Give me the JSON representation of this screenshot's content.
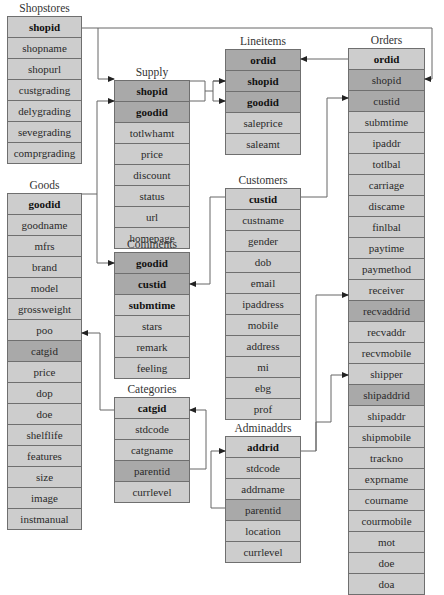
{
  "diagram": {
    "tables": [
      {
        "id": "shopstores",
        "name": "Shopstores",
        "fields": [
          {
            "name": "shopid",
            "pk": true,
            "fk": false
          },
          {
            "name": "shopname",
            "pk": false,
            "fk": false
          },
          {
            "name": "shopurl",
            "pk": false,
            "fk": false
          },
          {
            "name": "custgrading",
            "pk": false,
            "fk": false
          },
          {
            "name": "delygrading",
            "pk": false,
            "fk": false
          },
          {
            "name": "sevegrading",
            "pk": false,
            "fk": false
          },
          {
            "name": "comprgrading",
            "pk": false,
            "fk": false
          }
        ]
      },
      {
        "id": "goods",
        "name": "Goods",
        "fields": [
          {
            "name": "goodid",
            "pk": true,
            "fk": false
          },
          {
            "name": "goodname",
            "pk": false,
            "fk": false
          },
          {
            "name": "mfrs",
            "pk": false,
            "fk": false
          },
          {
            "name": "brand",
            "pk": false,
            "fk": false
          },
          {
            "name": "model",
            "pk": false,
            "fk": false
          },
          {
            "name": "grossweight",
            "pk": false,
            "fk": false
          },
          {
            "name": "poo",
            "pk": false,
            "fk": false
          },
          {
            "name": "catgid",
            "pk": false,
            "fk": true
          },
          {
            "name": "price",
            "pk": false,
            "fk": false
          },
          {
            "name": "dop",
            "pk": false,
            "fk": false
          },
          {
            "name": "doe",
            "pk": false,
            "fk": false
          },
          {
            "name": "shelflife",
            "pk": false,
            "fk": false
          },
          {
            "name": "features",
            "pk": false,
            "fk": false
          },
          {
            "name": "size",
            "pk": false,
            "fk": false
          },
          {
            "name": "image",
            "pk": false,
            "fk": false
          },
          {
            "name": "instmanual",
            "pk": false,
            "fk": false
          }
        ]
      },
      {
        "id": "supply",
        "name": "Supply",
        "fields": [
          {
            "name": "shopid",
            "pk": true,
            "fk": true
          },
          {
            "name": "goodid",
            "pk": true,
            "fk": true
          },
          {
            "name": "totlwhamt",
            "pk": false,
            "fk": false
          },
          {
            "name": "price",
            "pk": false,
            "fk": false
          },
          {
            "name": "discount",
            "pk": false,
            "fk": false
          },
          {
            "name": "status",
            "pk": false,
            "fk": false
          },
          {
            "name": "url",
            "pk": false,
            "fk": false
          },
          {
            "name": "homepage",
            "pk": false,
            "fk": false
          }
        ]
      },
      {
        "id": "comments",
        "name": "Comments",
        "fields": [
          {
            "name": "goodid",
            "pk": true,
            "fk": true
          },
          {
            "name": "custid",
            "pk": true,
            "fk": true
          },
          {
            "name": "submtime",
            "pk": true,
            "fk": false
          },
          {
            "name": "stars",
            "pk": false,
            "fk": false
          },
          {
            "name": "remark",
            "pk": false,
            "fk": false
          },
          {
            "name": "feeling",
            "pk": false,
            "fk": false
          }
        ]
      },
      {
        "id": "categories",
        "name": "Categories",
        "fields": [
          {
            "name": "catgid",
            "pk": true,
            "fk": false
          },
          {
            "name": "stdcode",
            "pk": false,
            "fk": false
          },
          {
            "name": "catgname",
            "pk": false,
            "fk": false
          },
          {
            "name": "parentid",
            "pk": false,
            "fk": true
          },
          {
            "name": "currlevel",
            "pk": false,
            "fk": false
          }
        ]
      },
      {
        "id": "lineitems",
        "name": "Lineitems",
        "fields": [
          {
            "name": "ordid",
            "pk": true,
            "fk": true
          },
          {
            "name": "shopid",
            "pk": true,
            "fk": true
          },
          {
            "name": "goodid",
            "pk": true,
            "fk": true
          },
          {
            "name": "saleprice",
            "pk": false,
            "fk": false
          },
          {
            "name": "saleamt",
            "pk": false,
            "fk": false
          }
        ]
      },
      {
        "id": "customers",
        "name": "Customers",
        "fields": [
          {
            "name": "custid",
            "pk": true,
            "fk": false
          },
          {
            "name": "custname",
            "pk": false,
            "fk": false
          },
          {
            "name": "gender",
            "pk": false,
            "fk": false
          },
          {
            "name": "dob",
            "pk": false,
            "fk": false
          },
          {
            "name": "email",
            "pk": false,
            "fk": false
          },
          {
            "name": "ipaddress",
            "pk": false,
            "fk": false
          },
          {
            "name": "mobile",
            "pk": false,
            "fk": false
          },
          {
            "name": "address",
            "pk": false,
            "fk": false
          },
          {
            "name": "mi",
            "pk": false,
            "fk": false
          },
          {
            "name": "ebg",
            "pk": false,
            "fk": false
          },
          {
            "name": "prof",
            "pk": false,
            "fk": false
          }
        ]
      },
      {
        "id": "adminaddrs",
        "name": "Adminaddrs",
        "fields": [
          {
            "name": "addrid",
            "pk": true,
            "fk": false
          },
          {
            "name": "stdcode",
            "pk": false,
            "fk": false
          },
          {
            "name": "addrname",
            "pk": false,
            "fk": false
          },
          {
            "name": "parentid",
            "pk": false,
            "fk": true
          },
          {
            "name": "location",
            "pk": false,
            "fk": false
          },
          {
            "name": "currlevel",
            "pk": false,
            "fk": false
          }
        ]
      },
      {
        "id": "orders",
        "name": "Orders",
        "fields": [
          {
            "name": "ordid",
            "pk": true,
            "fk": false
          },
          {
            "name": "shopid",
            "pk": false,
            "fk": true
          },
          {
            "name": "custid",
            "pk": false,
            "fk": true
          },
          {
            "name": "submtime",
            "pk": false,
            "fk": false
          },
          {
            "name": "ipaddr",
            "pk": false,
            "fk": false
          },
          {
            "name": "totlbal",
            "pk": false,
            "fk": false
          },
          {
            "name": "carriage",
            "pk": false,
            "fk": false
          },
          {
            "name": "discame",
            "pk": false,
            "fk": false
          },
          {
            "name": "finlbal",
            "pk": false,
            "fk": false
          },
          {
            "name": "paytime",
            "pk": false,
            "fk": false
          },
          {
            "name": "paymethod",
            "pk": false,
            "fk": false
          },
          {
            "name": "receiver",
            "pk": false,
            "fk": false
          },
          {
            "name": "recvaddrid",
            "pk": false,
            "fk": true
          },
          {
            "name": "recvaddr",
            "pk": false,
            "fk": false
          },
          {
            "name": "recvmobile",
            "pk": false,
            "fk": false
          },
          {
            "name": "shipper",
            "pk": false,
            "fk": false
          },
          {
            "name": "shipaddrid",
            "pk": false,
            "fk": true
          },
          {
            "name": "shipaddr",
            "pk": false,
            "fk": false
          },
          {
            "name": "shipmobile",
            "pk": false,
            "fk": false
          },
          {
            "name": "trackno",
            "pk": false,
            "fk": false
          },
          {
            "name": "exprname",
            "pk": false,
            "fk": false
          },
          {
            "name": "courname",
            "pk": false,
            "fk": false
          },
          {
            "name": "courmobile",
            "pk": false,
            "fk": false
          },
          {
            "name": "mot",
            "pk": false,
            "fk": false
          },
          {
            "name": "doe",
            "pk": false,
            "fk": false
          },
          {
            "name": "doa",
            "pk": false,
            "fk": false
          }
        ]
      }
    ],
    "relationships": [
      {
        "from": "shopstores.shopid",
        "to": "supply.shopid"
      },
      {
        "from": "shopstores.shopid",
        "to": "orders.shopid"
      },
      {
        "from": "goods.goodid",
        "to": "supply.goodid"
      },
      {
        "from": "goods.goodid",
        "to": "comments.goodid"
      },
      {
        "from": "supply.shopid",
        "to": "lineitems.shopid"
      },
      {
        "from": "supply.goodid",
        "to": "lineitems.goodid"
      },
      {
        "from": "orders.ordid",
        "to": "lineitems.ordid"
      },
      {
        "from": "customers.custid",
        "to": "comments.custid"
      },
      {
        "from": "customers.custid",
        "to": "orders.custid"
      },
      {
        "from": "categories.catgid",
        "to": "goods.catgid"
      },
      {
        "from": "categories.catgid",
        "to": "categories.parentid"
      },
      {
        "from": "adminaddrs.addrid",
        "to": "adminaddrs.parentid"
      },
      {
        "from": "adminaddrs.addrid",
        "to": "orders.recvaddrid"
      },
      {
        "from": "adminaddrs.addrid",
        "to": "orders.shipaddrid"
      }
    ],
    "colors": {
      "row_fill": "#cdcdcd",
      "key_fill": "#a9a9a9",
      "border": "#6f6f6f",
      "line": "#555555"
    }
  }
}
